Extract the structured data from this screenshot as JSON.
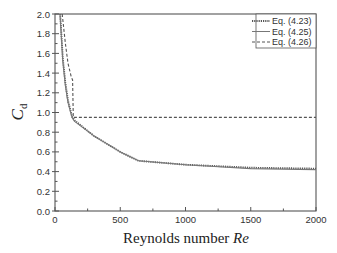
{
  "chart_data": {
    "type": "line",
    "title": "",
    "xlabel": "Reynolds number Re",
    "xlabel_parts": {
      "plain": "Reynolds number ",
      "italic": "Re"
    },
    "ylabel": "Cd",
    "ylabel_parts": {
      "main": "C",
      "sub": "d"
    },
    "xlim": [
      0,
      2000
    ],
    "ylim": [
      0.0,
      2.0
    ],
    "x_ticks": [
      0,
      500,
      1000,
      1500,
      2000
    ],
    "x_tick_labels": [
      "0",
      "500",
      "1000",
      "1500",
      "2000"
    ],
    "y_ticks": [
      0.0,
      0.2,
      0.4,
      0.6,
      0.8,
      1.0,
      1.2,
      1.4,
      1.6,
      1.8,
      2.0
    ],
    "y_tick_labels": [
      "0.0",
      "0.2",
      "0.4",
      "0.6",
      "0.8",
      "1.0",
      "1.2",
      "1.4",
      "1.6",
      "1.8",
      "2.0"
    ],
    "grid": false,
    "legend_position": "upper right",
    "series": [
      {
        "name": "Eq. (4.23)",
        "style": "dotted",
        "color": "#555555",
        "x": [
          40,
          60,
          80,
          100,
          130,
          150,
          300,
          500,
          640,
          1000,
          1500,
          2000
        ],
        "y": [
          2.0,
          1.55,
          1.3,
          1.12,
          0.96,
          0.92,
          0.76,
          0.6,
          0.51,
          0.47,
          0.44,
          0.43
        ]
      },
      {
        "name": "Eq. (4.25)",
        "style": "solid",
        "color": "#777777",
        "x": [
          38,
          60,
          80,
          100,
          130,
          150,
          300,
          500,
          640,
          1000,
          1500,
          2000
        ],
        "y": [
          2.0,
          1.52,
          1.27,
          1.1,
          0.95,
          0.91,
          0.76,
          0.6,
          0.51,
          0.47,
          0.43,
          0.42
        ]
      },
      {
        "name": "Eq. (4.26)",
        "style": "dashed",
        "color": "#555555",
        "x": [
          55,
          80,
          100,
          125,
          135,
          140,
          500,
          1000,
          1500,
          2000
        ],
        "y": [
          2.0,
          1.7,
          1.5,
          1.36,
          1.33,
          0.95,
          0.95,
          0.95,
          0.95,
          0.95
        ]
      }
    ]
  }
}
